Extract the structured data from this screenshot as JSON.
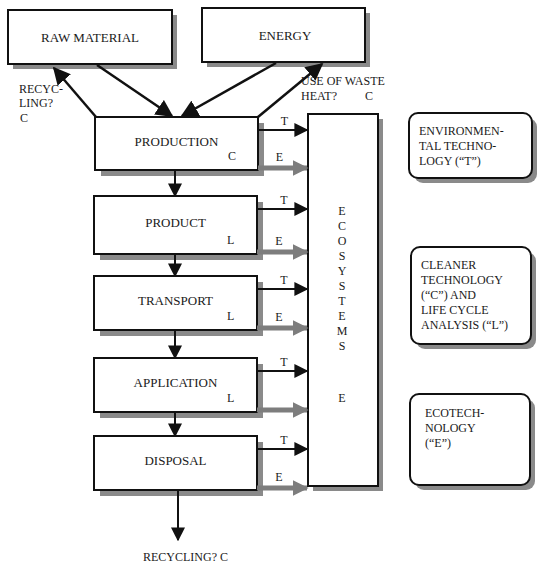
{
  "diagram": {
    "inputs": {
      "raw_material": "RAW MATERIAL",
      "energy": "ENERGY"
    },
    "stages": [
      {
        "label": "PRODUCTION",
        "tag": "C"
      },
      {
        "label": "PRODUCT",
        "tag": "L"
      },
      {
        "label": "TRANSPORT",
        "tag": "L"
      },
      {
        "label": "APPLICATION",
        "tag": "L"
      },
      {
        "label": "DISPOSAL",
        "tag": ""
      }
    ],
    "feedback": {
      "recycling_top_line1": "RECYC-",
      "recycling_top_line2": "LING?",
      "recycling_top_tag": "C",
      "waste_heat_line1": "USE OF WASTE",
      "waste_heat_line2": "HEAT?",
      "waste_heat_tag": "C",
      "recycling_bottom": "RECYCLING?  C"
    },
    "flow_labels": {
      "technology": "T",
      "ecotech": "E"
    },
    "ecosystems": {
      "letters": [
        "E",
        "C",
        "O",
        "S",
        "Y",
        "S",
        "T",
        "E",
        "M",
        "S"
      ],
      "tag": "E"
    },
    "legend": [
      {
        "lines": [
          "ENVIRONMEN-",
          "TAL TECHNO-",
          "LOGY   (“T”)"
        ]
      },
      {
        "lines": [
          "CLEANER",
          "TECHNOLOGY",
          "(“C”) AND",
          "LIFE CYCLE",
          "ANALYSIS (“L”)"
        ]
      },
      {
        "lines": [
          "ECOTECH-",
          "NOLOGY",
          "(“E”)"
        ]
      }
    ],
    "colors": {
      "stroke": "#111111",
      "shadow": "#8a8a8a",
      "e_arrow": "#7d7d7d"
    }
  }
}
